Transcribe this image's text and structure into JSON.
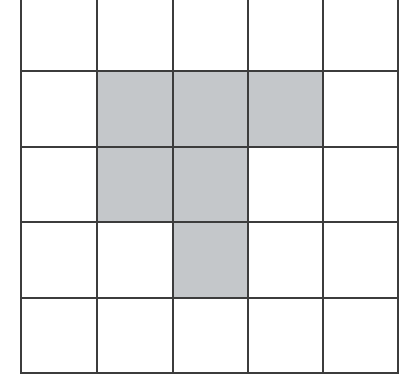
{
  "diagram": {
    "type": "grid",
    "rows": 5,
    "cols": 5,
    "fill_color": "#c4c7ca",
    "line_color": "#3c3c3c",
    "background": "#ffffff",
    "shaded_cells": [
      [
        1,
        1
      ],
      [
        1,
        2
      ],
      [
        1,
        3
      ],
      [
        2,
        1
      ],
      [
        2,
        2
      ],
      [
        3,
        2
      ]
    ]
  }
}
